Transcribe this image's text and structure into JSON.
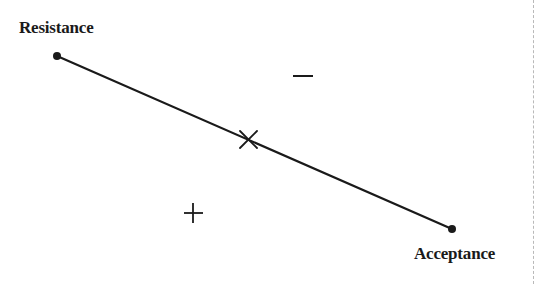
{
  "diagram": {
    "start_label": "Resistance",
    "end_label": "Acceptance",
    "continuum": {
      "start": {
        "x": 57,
        "y": 56
      },
      "end": {
        "x": 452,
        "y": 229
      },
      "midpoint_marker": {
        "symbol": "×",
        "x": 248,
        "y": 140
      }
    },
    "regions": [
      {
        "name": "negative",
        "symbol": "−",
        "x": 303,
        "y": 76
      },
      {
        "name": "positive",
        "symbol": "+",
        "x": 193,
        "y": 213
      }
    ],
    "colors": {
      "line": "#1a1a1a",
      "text": "#1a1a1a",
      "border": "#b9b9b9",
      "background": "#ffffff"
    }
  }
}
